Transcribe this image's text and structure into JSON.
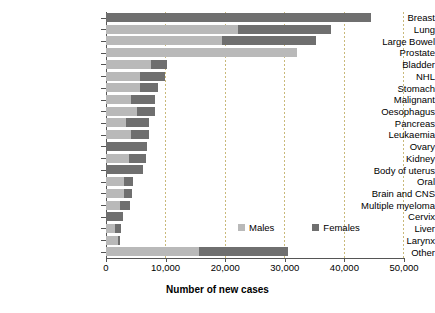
{
  "chart_data": {
    "type": "bar",
    "orientation": "horizontal",
    "stacked": true,
    "title": "",
    "xlabel": "Number of new cases",
    "ylabel": "",
    "xlim": [
      0,
      50000
    ],
    "xticks": [
      0,
      10000,
      20000,
      30000,
      40000,
      50000
    ],
    "xticklabels": [
      "0",
      "10,000",
      "20,000",
      "30,000",
      "40,000",
      "50,000"
    ],
    "grid": "vertical-dashed",
    "legend_position": "lower-right-inside",
    "categories": [
      "Breast",
      "Lung",
      "Large Bowel",
      "Prostate",
      "Bladder",
      "NHL",
      "Stomach",
      "Malignant",
      "Oesophagus",
      "Pancreas",
      "Leukaemia",
      "Ovary",
      "Kidney",
      "Body of uterus",
      "Oral",
      "Brain and CNS",
      "Multiple myeloma",
      "Cervix",
      "Liver",
      "Larynx",
      "Other"
    ],
    "series": [
      {
        "name": "Males",
        "color": "#b9b9b9",
        "values": [
          0,
          22200,
          19500,
          32000,
          7600,
          5700,
          5700,
          4200,
          5200,
          3400,
          4200,
          0,
          3900,
          0,
          3000,
          3000,
          2400,
          0,
          1500,
          2000,
          15600
        ]
      },
      {
        "name": "Females",
        "color": "#6f6f6f",
        "values": [
          44500,
          15500,
          15800,
          0,
          2700,
          4200,
          3000,
          4000,
          3000,
          3900,
          3000,
          6900,
          2800,
          6200,
          1500,
          1400,
          1600,
          2900,
          1000,
          350,
          14900
        ]
      }
    ],
    "totals": [
      44500,
      37700,
      35300,
      32000,
      10300,
      9900,
      8700,
      8200,
      8200,
      7300,
      7200,
      6900,
      6700,
      6200,
      4500,
      4400,
      4000,
      2900,
      2500,
      2350,
      30500
    ]
  },
  "legend": {
    "items": [
      {
        "label": "Males",
        "color": "#b9b9b9",
        "swatch": "males-swatch-icon"
      },
      {
        "label": "Females",
        "color": "#6f6f6f",
        "swatch": "females-swatch-icon"
      }
    ]
  },
  "axis": {
    "x_title": "Number of new cases"
  }
}
